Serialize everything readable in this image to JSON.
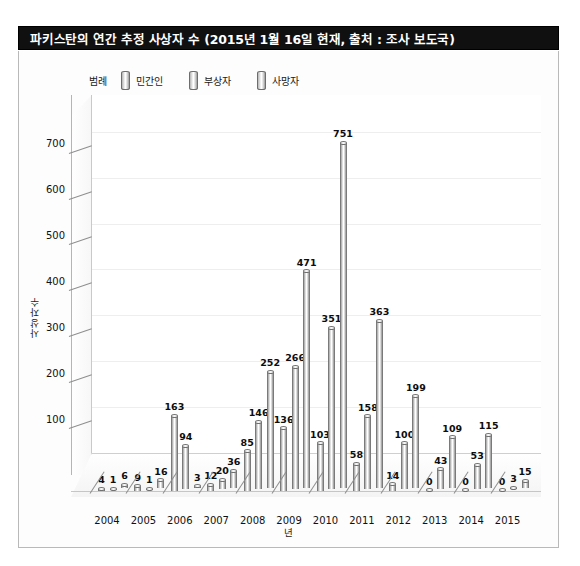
{
  "title": "파키스탄의 연간 추정 사상자 수 (2015년 1월 16일 현재, 출처 : 조사 보도국)",
  "legend": {
    "label": "범례",
    "entries": [
      "민간인",
      "부상자",
      "사망자"
    ]
  },
  "axes": {
    "y_title": "사상자수",
    "x_title": "년",
    "y_ticks": [
      100,
      200,
      300,
      400,
      500,
      600,
      700
    ]
  },
  "chart_data": {
    "type": "bar",
    "title": "파키스탄의 연간 추정 사상자 수 (2015년 1월 16일 현재, 출처 : 조사 보도국)",
    "xlabel": "년",
    "ylabel": "사상자수",
    "ylim": [
      0,
      780
    ],
    "grid": true,
    "legend_position": "top",
    "three_d": true,
    "categories": [
      "2004",
      "2005",
      "2006",
      "2007",
      "2008",
      "2009",
      "2010",
      "2011",
      "2012",
      "2013",
      "2014",
      "2015"
    ],
    "series": [
      {
        "name": "민간인",
        "values": [
          4,
          9,
          163,
          12,
          85,
          136,
          103,
          58,
          14,
          0,
          0,
          0
        ]
      },
      {
        "name": "부상자",
        "values": [
          1,
          1,
          94,
          20,
          146,
          266,
          351,
          158,
          100,
          43,
          53,
          3
        ]
      },
      {
        "name": "사망자",
        "values": [
          6,
          16,
          3,
          36,
          252,
          471,
          751,
          363,
          199,
          109,
          115,
          15
        ]
      }
    ],
    "bar_labels_shown": true,
    "yticklabels": [
      "100",
      "200",
      "300",
      "400",
      "500",
      "600",
      "700"
    ]
  }
}
